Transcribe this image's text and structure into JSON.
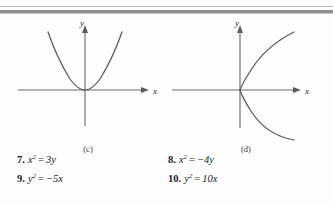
{
  "page": {
    "background_color": "#fdfdfd",
    "ink_color": "#1c1c1c",
    "rule_colors": {
      "thin": "#b9b9b9",
      "thick": "#8d8d8d"
    }
  },
  "figures": [
    {
      "panel_label": "(c)",
      "x_axis_label": "x",
      "y_axis_label": "y",
      "curve_description": "upward-opening parabola, vertex at origin",
      "curve_color": "#5b5b5b",
      "axis_color": "#6a6a6a"
    },
    {
      "panel_label": "(d)",
      "x_axis_label": "x",
      "y_axis_label": "y",
      "curve_description": "rightward-opening parabola, vertex at origin",
      "curve_color": "#5b5b5b",
      "axis_color": "#6a6a6a"
    }
  ],
  "exercises": {
    "rows": [
      {
        "left": {
          "number": "7.",
          "lhs": "x",
          "lhs_exp": "2",
          "operator": "=",
          "rhs": "3y"
        },
        "right": {
          "number": "8.",
          "lhs": "x",
          "lhs_exp": "2",
          "operator": "=",
          "rhs": "−4y"
        }
      },
      {
        "left": {
          "number": "9.",
          "lhs": "y",
          "lhs_exp": "2",
          "operator": "=",
          "rhs": "−5x"
        },
        "right": {
          "number": "10.",
          "lhs": "y",
          "lhs_exp": "2",
          "operator": "=",
          "rhs": "10x"
        }
      }
    ]
  }
}
